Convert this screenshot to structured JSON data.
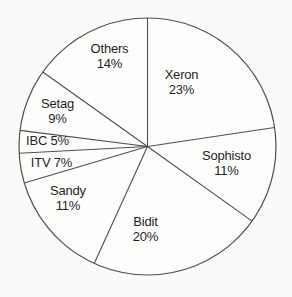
{
  "chart_data": {
    "type": "pie",
    "title": "",
    "legend_position": "none",
    "labels_inside_slices": true,
    "start_angle_deg": 0,
    "direction": "clockwise",
    "slices": [
      {
        "label": "Xeron",
        "value": 23,
        "display": "Xeron 23%",
        "two_line": true,
        "label_x": 181.5,
        "label_y": 82
      },
      {
        "label": "Sophisto",
        "value": 11,
        "display": "Sophisto 11%",
        "two_line": true,
        "label_x": 226.5,
        "label_y": 163
      },
      {
        "label": "Bidit",
        "value": 20,
        "display": "Bidit 20%",
        "two_line": true,
        "label_x": 145.5,
        "label_y": 229
      },
      {
        "label": "Sandy",
        "value": 11,
        "display": "Sandy 11%",
        "two_line": true,
        "label_x": 68,
        "label_y": 198
      },
      {
        "label": "ITV",
        "value": 7,
        "display": "ITV 7%",
        "two_line": false,
        "label_x": 51.5,
        "label_y": 162.5
      },
      {
        "label": "IBC",
        "value": 5,
        "display": "IBC 5%",
        "two_line": false,
        "label_x": 47.5,
        "label_y": 140
      },
      {
        "label": "Setag",
        "value": 9,
        "display": "Setag 9%",
        "two_line": true,
        "label_x": 57.5,
        "label_y": 110.5
      },
      {
        "label": "Others",
        "value": 14,
        "display": "Others 14%",
        "two_line": true,
        "label_x": 109.5,
        "label_y": 55.5
      }
    ],
    "drawn_boundaries_deg": [
      0,
      81.5,
      125.5,
      204.5,
      253.5,
      267.0,
      277.2,
      305.4
    ],
    "geometry": {
      "cx": 147.5,
      "cy": 146.5,
      "r": 128.5,
      "line_height": 15
    }
  },
  "colors": {
    "background": "#fafaf8",
    "circle_fill": "#fdfdfc",
    "stroke": "#4f4f4f",
    "text": "#1f1f1f"
  }
}
